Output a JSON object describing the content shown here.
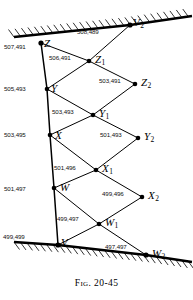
{
  "figure": {
    "caption": "Fig. 20-45",
    "title": "Fig. 20-45",
    "colors": {
      "line": "#000000",
      "ground": "#000000",
      "text": "#111111",
      "background": "#ffffff"
    }
  },
  "nodes": [
    {
      "id": "Z",
      "name": "Z",
      "sub": "",
      "coord": "507,491",
      "x": 41,
      "y": 43,
      "label_x": 44,
      "label_y": 38,
      "coord_x": 4,
      "coord_y": 44,
      "on_ground": true
    },
    {
      "id": "V2",
      "name": "V",
      "sub": "2",
      "coord": "508,489",
      "x": 130,
      "y": 25,
      "label_x": 133,
      "label_y": 17,
      "coord_x": 77,
      "coord_y": 29,
      "on_ground": true
    },
    {
      "id": "Z1",
      "name": "Z",
      "sub": "1",
      "coord": "506,491",
      "x": 89,
      "y": 61,
      "label_x": 95,
      "label_y": 54,
      "coord_x": 49,
      "coord_y": 55,
      "on_ground": false
    },
    {
      "id": "Z2",
      "name": "Z",
      "sub": "2",
      "coord": "503,491",
      "x": 135,
      "y": 84,
      "label_x": 141,
      "label_y": 77,
      "coord_x": 99,
      "coord_y": 78,
      "on_ground": false
    },
    {
      "id": "Y",
      "name": "Y",
      "sub": "",
      "coord": "505,493",
      "x": 47,
      "y": 89,
      "label_x": 51,
      "label_y": 83,
      "coord_x": 4,
      "coord_y": 86,
      "on_ground": false
    },
    {
      "id": "Y1",
      "name": "Y",
      "sub": "1",
      "coord": "503,493",
      "x": 93,
      "y": 115,
      "label_x": 99,
      "label_y": 108,
      "coord_x": 52,
      "coord_y": 109,
      "on_ground": false
    },
    {
      "id": "Y2",
      "name": "Y",
      "sub": "2",
      "coord": "501,493",
      "x": 138,
      "y": 138,
      "label_x": 144,
      "label_y": 131,
      "coord_x": 100,
      "coord_y": 132,
      "on_ground": false
    },
    {
      "id": "X",
      "name": "X",
      "sub": "",
      "coord": "503,495",
      "x": 50,
      "y": 135,
      "label_x": 55,
      "label_y": 130,
      "coord_x": 4,
      "coord_y": 132,
      "on_ground": false
    },
    {
      "id": "X1",
      "name": "X",
      "sub": "1",
      "coord": "501,496",
      "x": 96,
      "y": 170,
      "label_x": 102,
      "label_y": 163,
      "coord_x": 54,
      "coord_y": 165,
      "on_ground": false
    },
    {
      "id": "X2",
      "name": "X",
      "sub": "2",
      "coord": "499,496",
      "x": 142,
      "y": 197,
      "label_x": 148,
      "label_y": 190,
      "coord_x": 102,
      "coord_y": 191,
      "on_ground": false
    },
    {
      "id": "W",
      "name": "W",
      "sub": "",
      "coord": "501,497",
      "x": 54,
      "y": 188,
      "label_x": 60,
      "label_y": 182,
      "coord_x": 4,
      "coord_y": 186,
      "on_ground": false
    },
    {
      "id": "W1",
      "name": "W",
      "sub": "1",
      "coord": "499,497",
      "x": 99,
      "y": 224,
      "label_x": 105,
      "label_y": 217,
      "coord_x": 57,
      "coord_y": 216,
      "on_ground": false
    },
    {
      "id": "V",
      "name": "V",
      "sub": "",
      "coord": "499,499",
      "x": 58,
      "y": 245,
      "label_x": 61,
      "label_y": 237,
      "coord_x": 3,
      "coord_y": 234,
      "on_ground": true
    },
    {
      "id": "W2",
      "name": "W",
      "sub": "2",
      "coord": "497,497",
      "x": 146,
      "y": 255,
      "label_x": 152,
      "label_y": 248,
      "coord_x": 105,
      "coord_y": 244,
      "on_ground": true
    }
  ],
  "members": [
    {
      "from": "Z",
      "to": "Z1"
    },
    {
      "from": "Z1",
      "to": "Z2"
    },
    {
      "from": "Z1",
      "to": "Y"
    },
    {
      "from": "Z2",
      "to": "Y1"
    },
    {
      "from": "Y",
      "to": "Y1"
    },
    {
      "from": "Y1",
      "to": "Y2"
    },
    {
      "from": "Y1",
      "to": "X"
    },
    {
      "from": "Y2",
      "to": "X1"
    },
    {
      "from": "X",
      "to": "X1"
    },
    {
      "from": "X1",
      "to": "X2"
    },
    {
      "from": "X1",
      "to": "W"
    },
    {
      "from": "X2",
      "to": "W1"
    },
    {
      "from": "W",
      "to": "W1"
    },
    {
      "from": "W1",
      "to": "W2"
    },
    {
      "from": "W1",
      "to": "V"
    },
    {
      "from": "V2",
      "to": "Z1"
    }
  ],
  "chord": {
    "name": "left-chord",
    "points": "41,43 47,89 50,135 54,188 58,245"
  },
  "ground": {
    "upper": {
      "name": "upper-ground-surface",
      "line": "14,37 130,25 192,16",
      "hatch_side": "above"
    },
    "lower": {
      "name": "lower-ground-surface",
      "line": "14,242 58,245 146,255 192,262",
      "hatch_side": "below"
    }
  }
}
